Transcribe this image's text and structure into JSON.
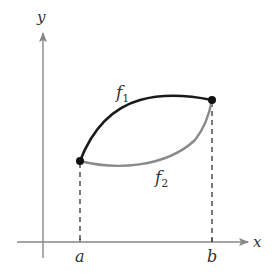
{
  "diagram": {
    "axes": {
      "x_label": "x",
      "y_label": "y",
      "color": "#888888"
    },
    "points": [
      {
        "name": "a",
        "label": "a"
      },
      {
        "name": "b",
        "label": "b"
      }
    ],
    "curves": [
      {
        "name": "f1",
        "base": "f",
        "subscript": "1",
        "color": "#1a1a1a",
        "position": "upper"
      },
      {
        "name": "f2",
        "base": "f",
        "subscript": "2",
        "color": "#8a8a8a",
        "position": "lower"
      }
    ],
    "guides": {
      "style": "dashed",
      "color": "#333333"
    }
  }
}
